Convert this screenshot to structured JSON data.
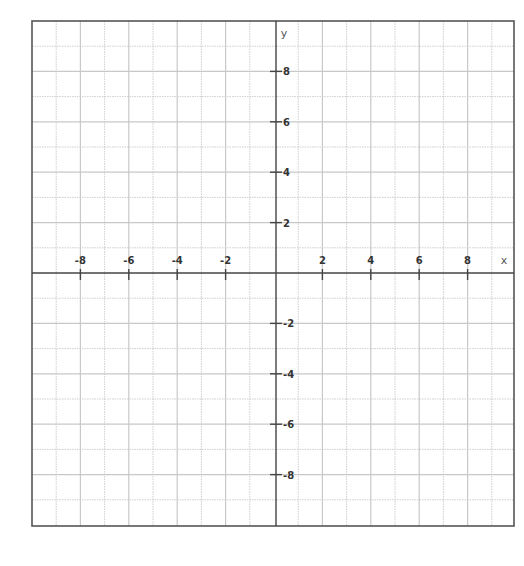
{
  "chart_data": {
    "type": "scatter",
    "title": "",
    "xlabel": "x",
    "ylabel": "y",
    "xlim": [
      -10,
      10
    ],
    "ylim": [
      -10,
      10
    ],
    "grid": true,
    "grid_step": 1,
    "x_ticks": [
      -8,
      -6,
      -4,
      -2,
      2,
      4,
      6,
      8
    ],
    "y_ticks": [
      8,
      6,
      4,
      2,
      -2,
      -4,
      -6,
      -8
    ],
    "x_tick_labels": [
      "-8",
      "-6",
      "-4",
      "-2",
      "2",
      "4",
      "6",
      "8"
    ],
    "y_tick_labels": [
      "8",
      "6",
      "4",
      "2",
      "-2",
      "-4",
      "-6",
      "-8"
    ],
    "series": [],
    "legend": null
  },
  "axes": {
    "x_name": "x",
    "y_name": "y"
  },
  "colors": {
    "frame": "#555555",
    "axis": "#444444",
    "grid": "#c8c8c8",
    "text": "#333333"
  },
  "layout": {
    "frame_left": 32,
    "frame_top": 21,
    "frame_right": 514,
    "frame_bottom": 526,
    "origin_x": 274,
    "origin_y": 273,
    "unit_x": 24.2,
    "unit_y": 25.2
  }
}
